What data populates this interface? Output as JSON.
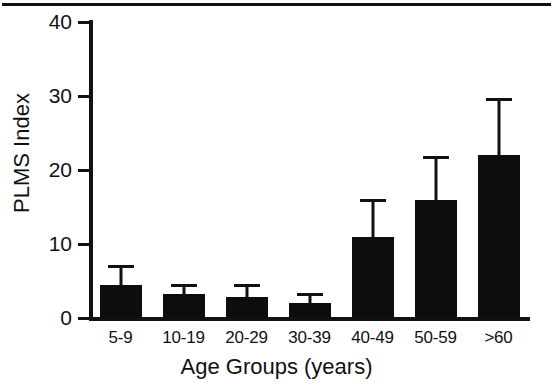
{
  "chart_data": {
    "type": "bar",
    "title": "",
    "xlabel": "Age Groups (years)",
    "ylabel": "PLMS Index",
    "categories": [
      "5-9",
      "10-19",
      "20-29",
      "30-39",
      "40-49",
      "50-59",
      ">60"
    ],
    "values": [
      4.5,
      3.2,
      2.8,
      2.0,
      11,
      16,
      22
    ],
    "errors_upper": [
      6.7,
      4.2,
      4.2,
      3.0,
      15.7,
      21.5,
      29.3
    ],
    "ylim": [
      0,
      40
    ],
    "yticks": [
      0,
      10,
      20,
      30,
      40
    ],
    "ytick_labels": [
      "0",
      "10",
      "20",
      "30",
      "40"
    ],
    "grid": false,
    "legend": false,
    "bar_color": "#0d0d0d",
    "axis_color": "#111111",
    "background": "#ffffff",
    "error_style": "upper-only-cap"
  },
  "axes": {
    "y_title": "PLMS Index",
    "x_title": "Age Groups (years)"
  }
}
